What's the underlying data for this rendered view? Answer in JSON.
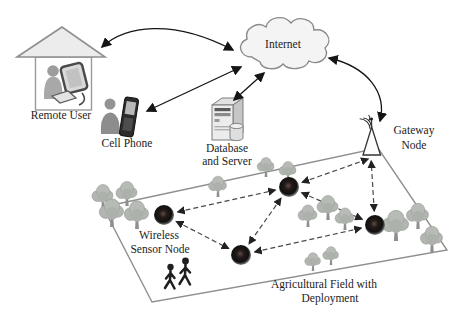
{
  "figure": {
    "type": "network-architecture-diagram",
    "labels": {
      "remote_user": "Remote User",
      "cell_phone": "Cell Phone",
      "internet": "Internet",
      "database_line1": "Database",
      "database_line2": "and Server",
      "gateway_line1": "Gateway",
      "gateway_line2": "Node",
      "wsn_line1": "Wireless",
      "wsn_line2": "Sensor Node",
      "field_line1": "Agricultural Field with",
      "field_line2": "Deployment"
    },
    "icons": {
      "house": "house-icon",
      "remote_user_person": "person-icon",
      "monitor": "computer-monitor-icon",
      "keyboard": "keyboard-icon",
      "phone_user": "person-icon",
      "cell_phone": "mobile-phone-icon",
      "internet": "cloud-icon",
      "server": "server-tower-icon",
      "database": "database-cylinder-icon",
      "gateway": "antenna-tower-icon",
      "wireless_waves": "wifi-waves-icon",
      "tree": "tree-icon",
      "people": "walking-people-icon",
      "sensor": "sensor-node-dot"
    },
    "colors": {
      "background": "#ffffff",
      "arrow": "#151515",
      "mesh_link": "#4a4a4a",
      "field_stroke": "#8f8f8f",
      "tree_foliage": "#b2b6b0",
      "tree_trunk": "#8f8f8f",
      "node_center": "#5f4c44",
      "node_dark": "#141110",
      "node_rim": "#9a9a9a"
    },
    "sensor_nodes": [
      {
        "id": "n1",
        "x": 164,
        "y": 215
      },
      {
        "id": "n2",
        "x": 289,
        "y": 187
      },
      {
        "id": "n3",
        "x": 241,
        "y": 255
      },
      {
        "id": "n4",
        "x": 375,
        "y": 225
      }
    ],
    "gateway_anchor": {
      "x": 371,
      "y": 158
    },
    "mesh_links": [
      [
        "n1",
        "n2"
      ],
      [
        "n1",
        "n3"
      ],
      [
        "n2",
        "n3"
      ],
      [
        "n2",
        "n4"
      ],
      [
        "n3",
        "n4"
      ],
      [
        "n2",
        "gw"
      ],
      [
        "n4",
        "gw"
      ]
    ]
  }
}
